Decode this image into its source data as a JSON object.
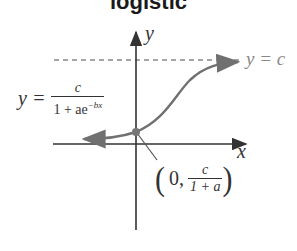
{
  "title": "logistic",
  "axes": {
    "x_label": "x",
    "y_label": "y"
  },
  "equation": {
    "lhs": "y =",
    "numerator": "c",
    "denominator_base": "1 + ae",
    "denominator_exponent": "−bx"
  },
  "asymptote": {
    "label": "y = c",
    "style": "dashed"
  },
  "intercept_point": {
    "open": "(",
    "x": "0,",
    "numerator": "c",
    "denominator": "1 + a",
    "close": ")"
  },
  "colors": {
    "axis": "#333333",
    "curve": "#707070",
    "asymptote": "#888888",
    "text": "#333333"
  }
}
